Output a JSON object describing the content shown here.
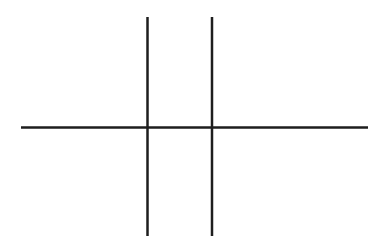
{
  "canvas": {
    "width": 388,
    "height": 251,
    "background_color": "#ffffff",
    "title": "Line Drawing"
  },
  "drawing": {
    "stroke_color": "#1e1e1e",
    "stroke_width": 2.5,
    "description": "Incomplete grid figure: two vertical lines crossed by one horizontal line",
    "lines": [
      {
        "id": "vertical-line-left",
        "orientation": "vertical",
        "x1": 147.5,
        "y1": 17,
        "x2": 147.5,
        "y2": 236,
        "color": "#1e1e1e",
        "width": 2.5
      },
      {
        "id": "vertical-line-right",
        "orientation": "vertical",
        "x1": 212,
        "y1": 17,
        "x2": 212,
        "y2": 236,
        "color": "#1e1e1e",
        "width": 2.5
      },
      {
        "id": "horizontal-line",
        "orientation": "horizontal",
        "x1": 21,
        "y1": 127.5,
        "x2": 368,
        "y2": 127.5,
        "color": "#1e1e1e",
        "width": 2.5
      }
    ],
    "intersections": [
      {
        "id": "intersection-left",
        "x": 147.5,
        "y": 127.5
      },
      {
        "id": "intersection-right",
        "x": 212,
        "y": 127.5
      }
    ]
  }
}
